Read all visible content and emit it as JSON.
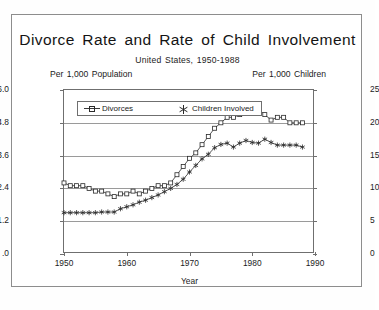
{
  "figure": {
    "title": "Divorce Rate and Rate of Child Involvement",
    "subtitle": "United States, 1950-1988",
    "left_axis_header": "Per 1,000 Population",
    "right_axis_header": "Per 1,000 Children",
    "xlabel": "Year"
  },
  "legend": {
    "entries": [
      {
        "label": "Divorces",
        "marker": "square-marker"
      },
      {
        "label": "Children Involved",
        "marker": "asterisk-marker"
      }
    ]
  },
  "axes": {
    "left_ticks": [
      "6.0",
      "4.8",
      "3.6",
      "2.4",
      "1.2",
      ".0"
    ],
    "right_ticks": [
      "25",
      "20",
      "15",
      "10",
      "5",
      "0"
    ],
    "x_ticks": [
      "1950",
      "1960",
      "1970",
      "1980",
      "1990"
    ]
  },
  "chart_data": {
    "type": "line",
    "title": "Divorce Rate and Rate of Child Involvement",
    "subtitle": "United States, 1950-1988",
    "xlabel": "Year",
    "ylabel": "Per 1,000 Population",
    "y2label": "Per 1,000 Children",
    "xlim": [
      1950,
      1990
    ],
    "ylim": [
      0.0,
      6.0
    ],
    "y2lim": [
      0,
      25
    ],
    "yticks": [
      0.0,
      1.2,
      2.4,
      3.6,
      4.8,
      6.0
    ],
    "y2ticks": [
      0,
      5,
      10,
      15,
      20,
      25
    ],
    "xticks": [
      1950,
      1960,
      1970,
      1980,
      1990
    ],
    "grid": true,
    "legend_position": "top-left-inside",
    "x": [
      1950,
      1951,
      1952,
      1953,
      1954,
      1955,
      1956,
      1957,
      1958,
      1959,
      1960,
      1961,
      1962,
      1963,
      1964,
      1965,
      1966,
      1967,
      1968,
      1969,
      1970,
      1971,
      1972,
      1973,
      1974,
      1975,
      1976,
      1977,
      1978,
      1979,
      1980,
      1981,
      1982,
      1983,
      1984,
      1985,
      1986,
      1987,
      1988
    ],
    "series": [
      {
        "name": "Divorces",
        "axis": "left",
        "marker": "square",
        "units": "per 1,000 population",
        "values": [
          2.6,
          2.5,
          2.5,
          2.5,
          2.4,
          2.3,
          2.3,
          2.2,
          2.1,
          2.2,
          2.2,
          2.3,
          2.2,
          2.3,
          2.4,
          2.5,
          2.5,
          2.6,
          2.9,
          3.2,
          3.5,
          3.7,
          4.0,
          4.3,
          4.6,
          4.8,
          5.0,
          5.0,
          5.1,
          5.3,
          5.2,
          5.3,
          5.1,
          4.9,
          5.0,
          5.0,
          4.8,
          4.8,
          4.8
        ]
      },
      {
        "name": "Children Involved",
        "axis": "right",
        "marker": "asterisk",
        "units": "per 1,000 children",
        "values": [
          6.3,
          6.3,
          6.3,
          6.3,
          6.3,
          6.3,
          6.4,
          6.4,
          6.4,
          6.9,
          7.2,
          7.5,
          7.9,
          8.2,
          8.6,
          9.0,
          9.5,
          10.0,
          10.6,
          11.4,
          12.5,
          13.5,
          14.5,
          15.2,
          16.2,
          16.7,
          16.9,
          16.3,
          16.9,
          17.3,
          17.0,
          16.9,
          17.5,
          17.0,
          16.6,
          16.6,
          16.6,
          16.6,
          16.3
        ]
      }
    ]
  }
}
